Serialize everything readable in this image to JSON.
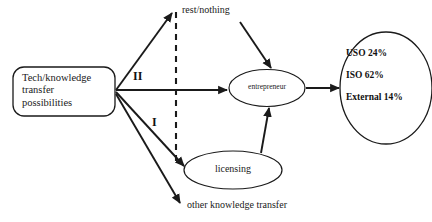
{
  "diagram": {
    "background_color": "#ffffff",
    "stroke_color": "#1a1a1a",
    "nodes": {
      "source_box": {
        "label": "Tech/knowledge\ntransfer\npossibilities",
        "shape": "rounded-rectangle"
      },
      "entrepreneur": {
        "label": "entrepreneur",
        "shape": "ellipse"
      },
      "licensing": {
        "label": "licensing",
        "shape": "ellipse"
      },
      "outcomes": {
        "shape": "ellipse",
        "items": [
          "USO 24%",
          "ISO 62%",
          "External 14%"
        ]
      }
    },
    "edge_labels": {
      "rest_nothing": "rest/nothing",
      "other_knowledge_transfer": "other knowledge transfer",
      "path_two": "II",
      "path_one": "I"
    }
  }
}
